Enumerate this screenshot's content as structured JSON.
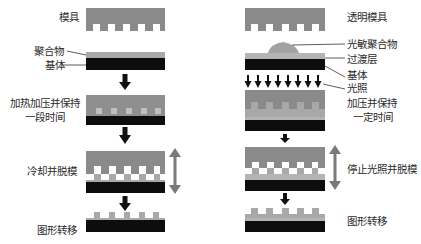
{
  "colors": {
    "mold": "#8a8a8a",
    "mold_dark": "#7b7b7b",
    "polymer": "#a8a8a8",
    "polymer_light": "#c4c4c4",
    "substrate": "#0d0d0d",
    "arrow": "#111111",
    "double_arrow": "#7a7a7a",
    "background": "#ffffff"
  },
  "left": {
    "title": "热压印",
    "labels": {
      "mold": "模具",
      "polymer": "聚合物",
      "substrate": "基体",
      "step_heat_press_line1": "加热加压并保持",
      "step_heat_press_line2": "一段时间",
      "step_cool_demold": "冷却并脱模",
      "step_transfer": "图形转移"
    }
  },
  "right": {
    "labels": {
      "mold": "透明模具",
      "photopolymer": "光敏聚合物",
      "transition_layer": "过渡层",
      "substrate": "基体",
      "light": "光照",
      "step_press_line1": "加压并保持",
      "step_press_line2": "一定时间",
      "step_stop_demold": "停止光照并脱模",
      "step_transfer": "图形转移"
    }
  }
}
